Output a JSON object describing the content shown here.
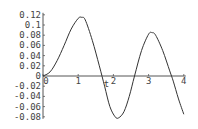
{
  "chart_data": {
    "type": "line",
    "title": "",
    "xlabel": "t",
    "ylabel": "",
    "xlim": [
      0,
      4
    ],
    "ylim": [
      -0.08,
      0.12
    ],
    "grid": false,
    "legend": null,
    "x_ticks": [
      "0",
      "1",
      "2",
      "3",
      "4"
    ],
    "y_ticks": [
      "0.12",
      "0.1",
      "0.08",
      "0.06",
      "0.04",
      "0.02",
      "0",
      "-0.02",
      "-0.04",
      "-0.06",
      "-0.08"
    ],
    "series": [
      {
        "name": "curve",
        "x": [
          0,
          0.2,
          0.4,
          0.6,
          0.8,
          1.0,
          1.1,
          1.2,
          1.4,
          1.6,
          1.75,
          1.9,
          2.05,
          2.15,
          2.3,
          2.45,
          2.6,
          2.8,
          3.0,
          3.1,
          3.2,
          3.4,
          3.6,
          3.7,
          3.85,
          4.0
        ],
        "y": [
          0,
          0.008,
          0.03,
          0.06,
          0.092,
          0.113,
          0.115,
          0.11,
          0.07,
          0.02,
          -0.02,
          -0.06,
          -0.08,
          -0.082,
          -0.07,
          -0.04,
          0.0,
          0.05,
          0.082,
          0.085,
          0.08,
          0.05,
          0.01,
          -0.01,
          -0.045,
          -0.075
        ]
      }
    ]
  }
}
